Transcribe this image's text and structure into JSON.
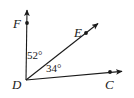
{
  "figure": {
    "type": "geometry-diagram",
    "background_color": "#ffffff",
    "stroke_color": "#1a1a1a",
    "vertex": "D",
    "points": [
      {
        "name": "F",
        "label": "F",
        "x": 27,
        "y": 23,
        "dot": true
      },
      {
        "name": "E",
        "label": "E",
        "x": 86,
        "y": 33,
        "dot": true
      },
      {
        "name": "D",
        "label": "D",
        "x": 26,
        "y": 80,
        "dot": false
      },
      {
        "name": "C",
        "label": "C",
        "x": 110,
        "y": 72,
        "dot": true
      }
    ],
    "rays": [
      {
        "name": "ray-DF",
        "from": "D",
        "through": "F",
        "arrow_at": {
          "x": 27,
          "y": 6
        }
      },
      {
        "name": "ray-DE",
        "from": "D",
        "through": "E",
        "arrow_at": {
          "x": 101,
          "y": 21
        }
      },
      {
        "name": "ray-DC",
        "from": "D",
        "through": "C",
        "arrow_at": {
          "x": 126,
          "y": 71
        }
      }
    ],
    "angles": [
      {
        "name": "angle-FDE",
        "between": "FD and DE",
        "value": "52",
        "label": "52°"
      },
      {
        "name": "angle-EDC",
        "between": "ED and DC",
        "value": "34",
        "label": "34°"
      }
    ]
  }
}
